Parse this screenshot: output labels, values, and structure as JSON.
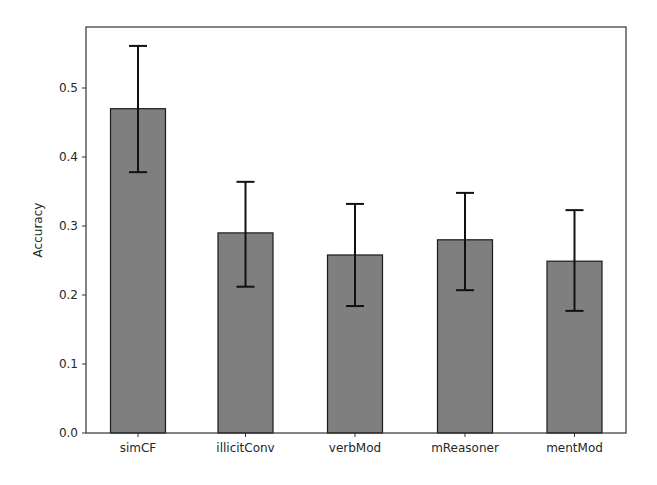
{
  "chart_data": {
    "type": "bar",
    "title": "",
    "xlabel": "",
    "ylabel": "Accuracy",
    "categories": [
      "simCF",
      "illicitConv",
      "verbMod",
      "mReasoner",
      "mentMod"
    ],
    "values": [
      0.47,
      0.29,
      0.258,
      0.28,
      0.249
    ],
    "error_low": [
      0.378,
      0.212,
      0.184,
      0.207,
      0.177
    ],
    "error_high": [
      0.561,
      0.364,
      0.332,
      0.348,
      0.323
    ],
    "ylim": [
      0.0,
      0.588
    ],
    "yticks": [
      0.0,
      0.1,
      0.2,
      0.3,
      0.4,
      0.5
    ],
    "ytick_labels": [
      "0.0",
      "0.1",
      "0.2",
      "0.3",
      "0.4",
      "0.5"
    ],
    "grid": false,
    "legend": null,
    "colors": {
      "bar_fill": "#7f7f7f",
      "bar_edge": "#1a1a1a",
      "error_bar": "#111111",
      "axes": "#333333"
    }
  }
}
